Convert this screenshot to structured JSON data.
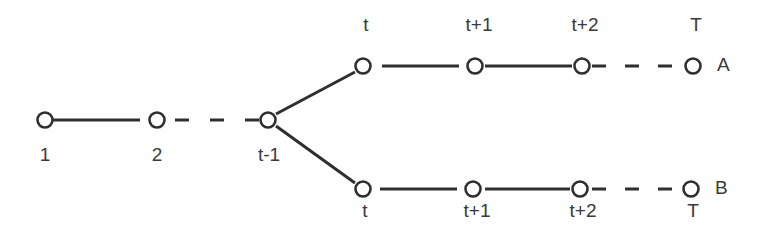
{
  "diagram": {
    "type": "branching timeline",
    "colors": {
      "line": "#2f2f2f",
      "text": "#3a3a3a",
      "background": "#ffffff"
    },
    "trunk": {
      "nodes": [
        {
          "id": "n1",
          "label": "1",
          "x": 45,
          "y": 120
        },
        {
          "id": "n2",
          "label": "2",
          "x": 157,
          "y": 120
        },
        {
          "id": "ntm1",
          "label": "t-1",
          "x": 268,
          "y": 120
        }
      ]
    },
    "branches": [
      {
        "name": "A",
        "y": 66,
        "nodes": [
          {
            "label": "t",
            "x": 363
          },
          {
            "label": "t+1",
            "x": 475
          },
          {
            "label": "t+2",
            "x": 582
          },
          {
            "label": "T",
            "x": 693
          }
        ]
      },
      {
        "name": "B",
        "y": 189,
        "nodes": [
          {
            "label": "t",
            "x": 363
          },
          {
            "label": "t+1",
            "x": 475
          },
          {
            "label": "t+2",
            "x": 582
          },
          {
            "label": "T",
            "x": 693
          }
        ]
      }
    ]
  }
}
